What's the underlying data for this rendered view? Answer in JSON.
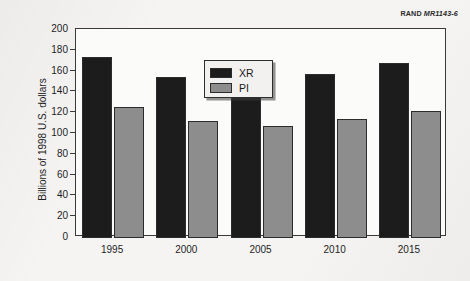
{
  "figure_id": {
    "brand": "RAND",
    "number": "MR1143-6"
  },
  "chart_data": {
    "type": "bar",
    "title": "",
    "subtitle": "",
    "xlabel": "",
    "ylabel": "Billions of 1998 U.S. dollars",
    "categories": [
      "1995",
      "2000",
      "2005",
      "2010",
      "2015"
    ],
    "series": [
      {
        "name": "XR",
        "color": "#1c1c1c",
        "values": [
          173,
          154,
          151,
          157,
          167
        ]
      },
      {
        "name": "PI",
        "color": "#8d8d8d",
        "values": [
          125,
          112,
          107,
          113,
          121
        ]
      }
    ],
    "ylim": [
      0,
      200
    ],
    "ytick_step": 20,
    "yticks": [
      "200",
      "180",
      "160",
      "140",
      "120",
      "100",
      "80",
      "60",
      "40",
      "20",
      "0"
    ],
    "grid": false,
    "legend_position": "top-left-inside",
    "legend_entries": [
      "XR",
      "PI"
    ]
  }
}
